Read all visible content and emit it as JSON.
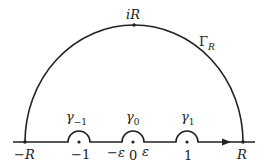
{
  "diagram": {
    "stroke_color": "#222222",
    "labels": {
      "top": "iR",
      "gamma_R": "Γ",
      "gamma_R_sub": "R",
      "gamma_m1": "γ",
      "gamma_m1_sub": "−1",
      "gamma_0": "γ",
      "gamma_0_sub": "0",
      "gamma_1": "γ",
      "gamma_1_sub": "1",
      "neg_R": "−R",
      "neg_1": "−1",
      "neg_eps": "−ε",
      "zero": "0",
      "eps": "ε",
      "one": "1",
      "R": "R"
    }
  }
}
